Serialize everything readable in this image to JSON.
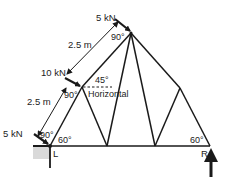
{
  "diagram": {
    "type": "truss",
    "colors": {
      "member": "#1a1a1a",
      "support_shade": "#d0d0d0",
      "text": "#222222"
    },
    "loads": [
      {
        "id": "load-top",
        "label": "5 kN"
      },
      {
        "id": "load-middle",
        "label": "10 kN"
      },
      {
        "id": "load-bottom",
        "label": "5 kN"
      }
    ],
    "dimensions": [
      {
        "id": "dim-upper",
        "label": "2.5 m"
      },
      {
        "id": "dim-lower",
        "label": "2.5 m"
      }
    ],
    "angles": {
      "top_right_angle": "90°",
      "middle_right_angle": "90°",
      "bottom_right_angle": "90°",
      "left_base": "60°",
      "right_base": "60°",
      "load_angle": "45°"
    },
    "reference_label": "Horizontal",
    "supports": [
      {
        "id": "support-left",
        "label": "L"
      },
      {
        "id": "support-right",
        "label": "R"
      }
    ]
  }
}
